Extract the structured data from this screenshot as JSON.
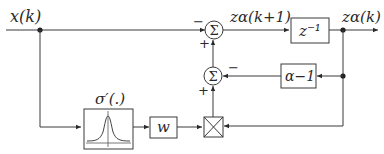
{
  "diagram": {
    "title": "",
    "nodes": {
      "input_label": "x(k)",
      "next_state_label": "zα(k+1)",
      "output_label": "zα(k)",
      "delay_block": "z⁻¹",
      "feedback_block": "α−1",
      "activation_label": "σ′(.)",
      "weight_block": "w",
      "sum_symbol": "Σ"
    },
    "signs": {
      "sum_top_minus": "−",
      "sum_top_plus": "+",
      "sum_mid_minus": "−",
      "sum_mid_plus": "+"
    },
    "edges": [
      {
        "from": "x(k)",
        "to": "sum_top",
        "sign": "-"
      },
      {
        "from": "sum_top",
        "to": "delay_block",
        "label": "zα(k+1)"
      },
      {
        "from": "delay_block",
        "to": "output",
        "label": "zα(k)"
      },
      {
        "from": "output",
        "to": "feedback_block"
      },
      {
        "from": "feedback_block",
        "to": "sum_mid",
        "sign": "-"
      },
      {
        "from": "sum_mid",
        "to": "sum_top",
        "sign": "+"
      },
      {
        "from": "x(k)",
        "to": "activation_block"
      },
      {
        "from": "activation_block",
        "to": "weight_block"
      },
      {
        "from": "weight_block",
        "to": "multiplier"
      },
      {
        "from": "output",
        "to": "multiplier"
      },
      {
        "from": "multiplier",
        "to": "sum_mid",
        "sign": "+"
      }
    ]
  }
}
